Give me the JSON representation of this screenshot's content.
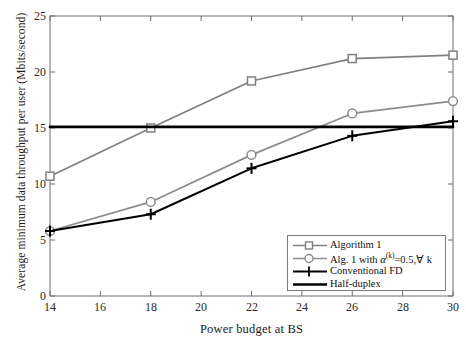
{
  "chart_data": {
    "type": "line",
    "title": "",
    "xlabel": "Power budget at BS",
    "ylabel": "Average minimum data throughput per user (Mbits/second)",
    "x": [
      14,
      18,
      22,
      26,
      30
    ],
    "xlim": [
      14,
      30
    ],
    "ylim": [
      0,
      25
    ],
    "xticks": [
      "14",
      "16",
      "18",
      "20",
      "22",
      "24",
      "26",
      "28",
      "30"
    ],
    "xtick_values": [
      14,
      16,
      18,
      20,
      22,
      24,
      26,
      28,
      30
    ],
    "yticks": [
      "0",
      "5",
      "10",
      "15",
      "20",
      "25"
    ],
    "ytick_values": [
      0,
      5,
      10,
      15,
      20,
      25
    ],
    "grid": false,
    "legend_position": "lower right",
    "series": [
      {
        "name": "Algorithm 1",
        "marker": "square",
        "color": "#808080",
        "values": [
          10.7,
          15.0,
          19.2,
          21.2,
          21.5
        ]
      },
      {
        "name": "Alg. 1 with α(k)=0.5,∀ k",
        "name_base": "Alg. 1 with ",
        "name_alpha": "α",
        "name_sup": "(k)",
        "name_tail": "=0.5,∀ k",
        "marker": "circle",
        "color": "#8c8c8c",
        "values": [
          5.8,
          8.4,
          12.6,
          16.3,
          17.4
        ]
      },
      {
        "name": "Conventional FD",
        "marker": "plus",
        "color": "#000000",
        "values": [
          5.8,
          7.3,
          11.4,
          14.3,
          15.6
        ]
      },
      {
        "name": "Half-duplex",
        "marker": "none",
        "color": "#000000",
        "values": [
          15.1,
          15.1,
          15.1,
          15.1,
          15.1
        ],
        "constant": 15.1
      }
    ]
  },
  "legend": {
    "items": [
      {
        "label": "Algorithm 1"
      },
      {
        "label_base": "Alg. 1 with ",
        "label_alpha": "α",
        "label_sup": "(k)",
        "label_tail": "=0.5,∀ k"
      },
      {
        "label": "Conventional FD"
      },
      {
        "label": "Half-duplex"
      }
    ]
  },
  "axes": {
    "xlabel": "Power budget at BS",
    "ylabel": "Average minimum data throughput per user (Mbits/second)",
    "xtick_labels": [
      "14",
      "16",
      "18",
      "20",
      "22",
      "24",
      "26",
      "28",
      "30"
    ],
    "ytick_labels": [
      "0",
      "5",
      "10",
      "15",
      "20",
      "25"
    ]
  },
  "colors": {
    "gray_series": "#808080",
    "black_series": "#000000",
    "axis": "#6e6e6e"
  }
}
